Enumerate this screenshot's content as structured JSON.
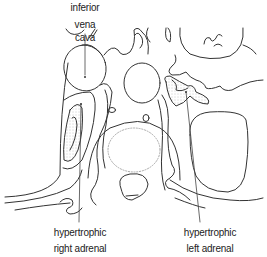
{
  "figure": {
    "type": "anatomical line drawing",
    "view": "axial cross-section at adrenal level",
    "labels": {
      "ivc_line1": "inferior",
      "ivc_line2": "vena cava",
      "right_adrenal_line1": "hypertrophic",
      "right_adrenal_line2": "right adrenal",
      "left_adrenal_line1": "hypertrophic",
      "left_adrenal_line2": "left adrenal"
    },
    "colors": {
      "line": "#333333",
      "stipple": "#888888",
      "dotted_outline": "#aaaaaa",
      "background": "#ffffff"
    }
  }
}
